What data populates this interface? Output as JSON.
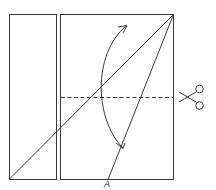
{
  "diagram": {
    "type": "paper-folding-instruction",
    "colors": {
      "stroke": "#3a3a3a",
      "background": "#ffffff"
    },
    "shapes": {
      "left_panel": {
        "x": 9,
        "y": 14,
        "w": 47,
        "h": 166
      },
      "right_panel": {
        "x": 60,
        "y": 14,
        "w": 114,
        "h": 166
      },
      "diagonal_line": {
        "x1": 9,
        "y1": 179,
        "x2": 174,
        "y2": 14
      },
      "fold_line_to_A": {
        "x1": 174,
        "y1": 14,
        "x2": 108,
        "y2": 180
      },
      "cut_line": {
        "x1": 60,
        "y1": 97,
        "x2": 174,
        "y2": 97,
        "style": "dashed"
      },
      "fold_arrow": {
        "from": [
          122,
          148
        ],
        "to": [
          127,
          26
        ],
        "style": "curved-double-arrow"
      }
    },
    "icons": {
      "cut": "scissors-icon"
    },
    "labels": {
      "point_a": "A"
    }
  }
}
